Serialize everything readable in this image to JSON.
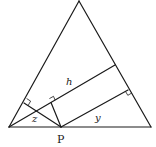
{
  "diagram": {
    "type": "geometry",
    "labels": {
      "h": "h",
      "y": "y",
      "z": "z",
      "p": "P"
    },
    "points": {
      "A_bottom_left": [
        9,
        127
      ],
      "B_bottom_right": [
        151,
        127
      ],
      "C_apex": [
        79,
        1
      ],
      "P": [
        61,
        127
      ],
      "foot_h_on_right_side": [
        115,
        65
      ],
      "foot_y_on_right_side": [
        128,
        90
      ],
      "foot_z_on_left_side": [
        24,
        103
      ]
    },
    "segments": [
      {
        "name": "base",
        "from": "A_bottom_left",
        "to": "B_bottom_right"
      },
      {
        "name": "left-side",
        "from": "A_bottom_left",
        "to": "C_apex"
      },
      {
        "name": "right-side",
        "from": "B_bottom_right",
        "to": "C_apex"
      },
      {
        "name": "altitude-h",
        "from": "A_bottom_left",
        "to": "foot_h_on_right_side"
      },
      {
        "name": "perpendicular-y",
        "from": "P",
        "to": "foot_y_on_right_side"
      },
      {
        "name": "perpendicular-z",
        "from": "P",
        "to": "foot_z_on_left_side"
      },
      {
        "name": "perpendicular-P-to-h",
        "from": "P",
        "to": "foot_P_on_h"
      }
    ],
    "colors": {
      "stroke": "#1a1a1a",
      "background": "#ffffff"
    }
  }
}
